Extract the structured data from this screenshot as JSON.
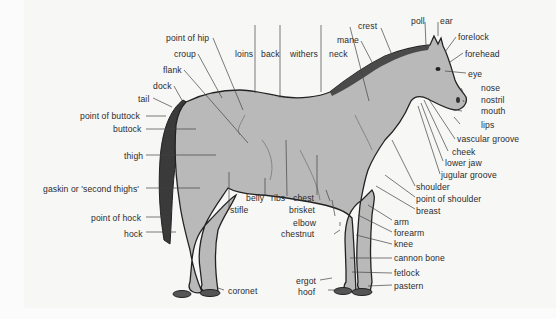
{
  "diagram": {
    "colors": {
      "body": "#b9b9b9",
      "outline": "#222222",
      "tail": "#3a3a3a",
      "leader": "#444444",
      "text": "#2b2b2b",
      "background": "#f7f7f6"
    },
    "labels": {
      "point_of_hip": "point of hip",
      "croup": "croup",
      "loins": "loins",
      "back": "back",
      "withers": "withers",
      "neck": "neck",
      "mane": "mane",
      "crest": "crest",
      "poll": "poll",
      "ear": "ear",
      "forelock": "forelock",
      "forehead": "forehead",
      "eye": "eye",
      "nose": "nose",
      "nostril": "nostril",
      "mouth": "mouth",
      "lips": "lips",
      "vascular_groove": "vascular groove",
      "cheek": "cheek",
      "lower_jaw": "lower jaw",
      "jugular_groove": "jugular groove",
      "shoulder": "shoulder",
      "point_of_shoulder": "point of shoulder",
      "breast": "breast",
      "arm": "arm",
      "forearm": "forearm",
      "knee": "knee",
      "cannon_bone": "cannon bone",
      "fetlock": "fetlock",
      "pastern": "pastern",
      "hoof": "hoof",
      "ergot": "ergot",
      "chestnut": "chestnut",
      "elbow": "elbow",
      "brisket": "brisket",
      "chest": "chest",
      "ribs": "ribs",
      "belly": "belly",
      "stifle": "stifle",
      "coronet": "coronet",
      "flank": "flank",
      "dock": "dock",
      "tail": "tail",
      "point_of_buttock": "point of buttock",
      "buttock": "buttock",
      "thigh": "thigh",
      "gaskin": "gaskin or 'second thighs'",
      "point_of_hock": "point of hock",
      "hock": "hock"
    }
  }
}
